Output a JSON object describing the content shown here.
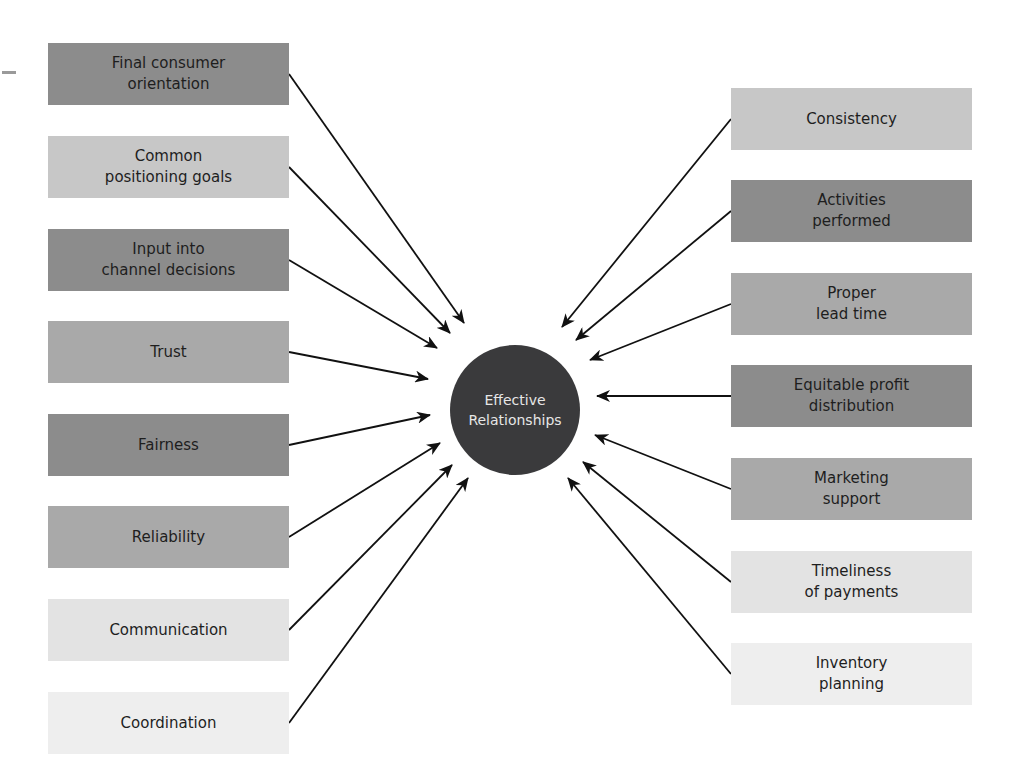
{
  "diagram": {
    "type": "hub-and-spoke",
    "center": {
      "label": "Effective\nRelationships",
      "color": "#3a3a3c"
    },
    "left_factors": [
      {
        "label": "Final consumer\norientation",
        "shade": "dark"
      },
      {
        "label": "Common\npositioning goals",
        "shade": "light"
      },
      {
        "label": "Input into\nchannel decisions",
        "shade": "dark"
      },
      {
        "label": "Trust",
        "shade": "mid"
      },
      {
        "label": "Fairness",
        "shade": "dark"
      },
      {
        "label": "Reliability",
        "shade": "mid"
      },
      {
        "label": "Communication",
        "shade": "pale"
      },
      {
        "label": "Coordination",
        "shade": "paler"
      }
    ],
    "right_factors": [
      {
        "label": "Consistency",
        "shade": "light"
      },
      {
        "label": "Activities\nperformed",
        "shade": "dark"
      },
      {
        "label": "Proper\nlead time",
        "shade": "mid"
      },
      {
        "label": "Equitable profit\ndistribution",
        "shade": "dark"
      },
      {
        "label": "Marketing\nsupport",
        "shade": "mid"
      },
      {
        "label": "Timeliness\nof payments",
        "shade": "pale"
      },
      {
        "label": "Inventory\nplanning",
        "shade": "paler"
      }
    ],
    "colors": {
      "dark": "#8c8c8c",
      "mid": "#a9a9a9",
      "light": "#c7c7c7",
      "pale": "#e3e3e3",
      "paler": "#eeeeee",
      "arrow": "#111111"
    }
  }
}
